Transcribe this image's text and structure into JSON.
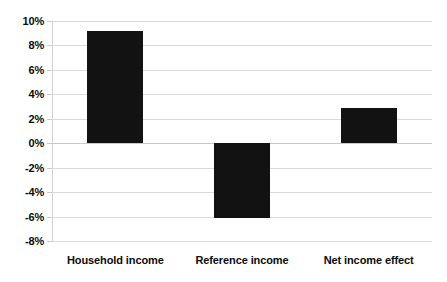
{
  "chart_data": {
    "type": "bar",
    "title": "",
    "subtitle": "",
    "xlabel": "",
    "ylabel": "",
    "categories": [
      "Household income",
      "Reference income",
      "Net income effect"
    ],
    "values": [
      9.2,
      -6.1,
      2.9
    ],
    "value_labels": [
      "9.2%",
      "-6.1%",
      "2.9%"
    ],
    "ylim": [
      -8,
      10
    ],
    "ytick_values": [
      10,
      8,
      6,
      4,
      2,
      0,
      -2,
      -4,
      -6,
      -8
    ],
    "ytick_labels": [
      "10%",
      "8%",
      "6%",
      "4%",
      "2%",
      "0%",
      "-2%",
      "-4%",
      "-6%",
      "-8%"
    ],
    "grid": true,
    "legend": false,
    "legend_position": "none",
    "series": [
      {
        "name": "",
        "values": [
          9.2,
          -6.1,
          2.9
        ],
        "color": "#121212"
      }
    ],
    "colors": {
      "bar": "#121212",
      "gridline": "#d9d9d9",
      "axis": "#d0d0d0",
      "text": "#0b0b0b",
      "background": "#ffffff"
    }
  }
}
